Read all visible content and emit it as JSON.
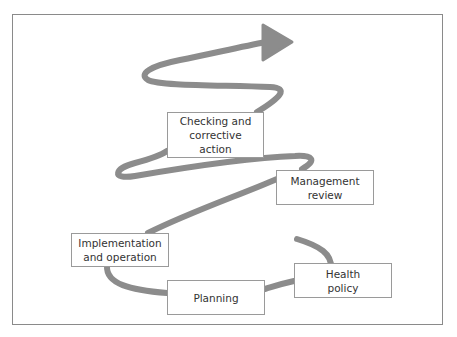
{
  "diagram": {
    "type": "upward spiral cycle",
    "stroke_color": "#8c8c8c",
    "border_color": "#8a8a8a",
    "stages": [
      {
        "id": "health-policy",
        "label": "Health\npolicy"
      },
      {
        "id": "planning",
        "label": "Planning"
      },
      {
        "id": "implementation",
        "label": "Implementation\nand operation"
      },
      {
        "id": "management-review",
        "label": "Management\nreview"
      },
      {
        "id": "checking",
        "label": "Checking and\ncorrective\naction"
      }
    ]
  }
}
